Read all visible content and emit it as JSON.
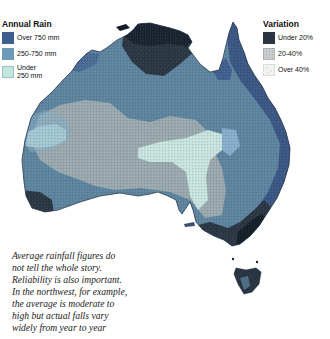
{
  "legend_rain": {
    "title": "Annual Rain",
    "items": [
      {
        "label": "Over 750 mm",
        "color": "#3f5f91"
      },
      {
        "label": "250-750 mm",
        "color": "#6f9ab7"
      },
      {
        "label": "Under\n250 mm",
        "color": "#c8e4e2"
      }
    ]
  },
  "legend_variation": {
    "title": "Variation",
    "items": [
      {
        "label": "Under 20%",
        "pattern": "dense-dark"
      },
      {
        "label": "20-40%",
        "pattern": "medium-stipple"
      },
      {
        "label": "Over 40%",
        "pattern": "light-stipple"
      }
    ]
  },
  "caption": "Average rainfall figures do not tell the whole story. Reliability is also important. In the northwest, for example, the average is moderate to high but actual falls vary widely from year to year",
  "caption_lines": [
    "Average rainfall figures do",
    "not tell the whole story.",
    "Reliability is also important.",
    "In the northwest, for example,",
    "the average is moderate to",
    "high but actual falls vary",
    "widely from year to year"
  ],
  "map": {
    "region": "Australia",
    "colors": {
      "over_750": "#3a5684",
      "mid": "#5f86a2",
      "under_250": "#c6e0dc",
      "interior_stipple": "#8e9ea4",
      "reliable_dark": "#1f2a36"
    }
  }
}
